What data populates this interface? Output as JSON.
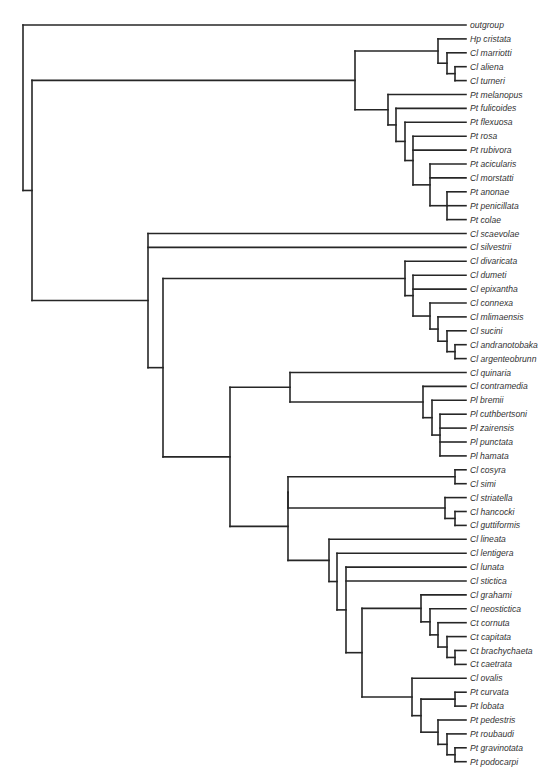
{
  "figure": {
    "type": "phylogenetic-tree",
    "line_color": "#262626",
    "label_x": 430,
    "leaf_end_x": 427,
    "first_leaf_y": 25,
    "leaf_step": 13.9
  },
  "leaves": [
    "outgroup",
    "Hp cristata",
    "Cl marriotti",
    "Cl aliena",
    "Cl turneri",
    "Pt melanopus",
    "Pt fulicoides",
    "Pt flexuosa",
    "Pt rosa",
    "Pt rubivora",
    "Pt acicularis",
    "Cl morstatti",
    "Pt anonae",
    "Pt penicillata",
    "Pt colae",
    "Cl scaevolae",
    "Cl silvestrii",
    "Cl divaricata",
    "Cl dumeti",
    "Cl epixantha",
    "Cl connexa",
    "Cl mlimaensis",
    "Cl sucini",
    "Cl andranotobaka",
    "Cl argenteobrunn",
    "Cl quinaria",
    "Cl contramedia",
    "Pl bremii",
    "Pl cuthbertsoni",
    "Pl zairensis",
    "Pl punctata",
    "Pl hamata",
    "Cl cosyra",
    "Cl simi",
    "Cl striatella",
    "Cl hancocki",
    "Cl guttiformis",
    "Cl lineata",
    "Cl lentigera",
    "Cl lunata",
    "Cl stictica",
    "Cl grahami",
    "Cl neostictica",
    "Ct cornuta",
    "Ct capitata",
    "Ct brachychaeta",
    "Ct caetrata",
    "Cl ovalis",
    "Pt curvata",
    "Pt lobata",
    "Pt pedestris",
    "Pt roubaudi",
    "Pt gravinotata",
    "Pt podocarpi"
  ],
  "tree": {
    "x": 23,
    "children": [
      {
        "leaf": 0
      },
      {
        "x": 32,
        "children": [
          {
            "x": 355,
            "children": [
              {
                "x": 438,
                "children": [
                  {
                    "leaf": 1
                  },
                  {
                    "x": 447,
                    "children": [
                      {
                        "leaf": 2
                      },
                      {
                        "x": 455,
                        "children": [
                          {
                            "leaf": 3
                          },
                          {
                            "leaf": 4
                          }
                        ]
                      }
                    ]
                  }
                ]
              },
              {
                "x": 388,
                "children": [
                  {
                    "leaf": 5
                  },
                  {
                    "x": 396,
                    "children": [
                      {
                        "leaf": 6
                      },
                      {
                        "x": 405,
                        "children": [
                          {
                            "leaf": 7
                          },
                          {
                            "x": 413,
                            "children": [
                              {
                                "leaf": 8
                              },
                              {
                                "leaf": 9
                              },
                              {
                                "x": 430,
                                "children": [
                                  {
                                    "leaf": 10
                                  },
                                  {
                                    "leaf": 11
                                  },
                                  {
                                    "x": 447,
                                    "children": [
                                      {
                                        "leaf": 12
                                      },
                                      {
                                        "leaf": 13
                                      },
                                      {
                                        "leaf": 14
                                      }
                                    ]
                                  }
                                ]
                              }
                            ]
                          }
                        ]
                      }
                    ]
                  }
                ]
              }
            ]
          },
          {
            "x": 148,
            "children": [
              {
                "leaf": 15
              },
              {
                "leaf": 16
              },
              {
                "x": 163,
                "children": [
                  {
                    "x": 405,
                    "children": [
                      {
                        "leaf": 17
                      },
                      {
                        "x": 413,
                        "children": [
                          {
                            "leaf": 18
                          },
                          {
                            "leaf": 19
                          },
                          {
                            "x": 430,
                            "children": [
                              {
                                "leaf": 20
                              },
                              {
                                "x": 438,
                                "children": [
                                  {
                                    "leaf": 21
                                  },
                                  {
                                    "x": 447,
                                    "children": [
                                      {
                                        "leaf": 22
                                      },
                                      {
                                        "x": 455,
                                        "children": [
                                          {
                                            "leaf": 23
                                          },
                                          {
                                            "leaf": 24
                                          }
                                        ]
                                      }
                                    ]
                                  }
                                ]
                              }
                            ]
                          }
                        ]
                      }
                    ]
                  },
                  {
                    "x": 230,
                    "children": [
                      {
                        "x": 290,
                        "children": [
                          {
                            "leaf": 25
                          },
                          {
                            "x": 423,
                            "children": [
                              {
                                "leaf": 26
                              },
                              {
                                "x": 432,
                                "children": [
                                  {
                                    "leaf": 27
                                  },
                                  {
                                    "x": 440,
                                    "children": [
                                      {
                                        "leaf": 28
                                      },
                                      {
                                        "leaf": 29
                                      },
                                      {
                                        "leaf": 30
                                      },
                                      {
                                        "leaf": 31
                                      }
                                    ]
                                  }
                                ]
                              }
                            ]
                          }
                        ]
                      },
                      {
                        "x": 288,
                        "children": [
                          {
                            "x": 288,
                            "children": [
                              {
                                "x": 455,
                                "children": [
                                  {
                                    "leaf": 32
                                  },
                                  {
                                    "leaf": 33
                                  }
                                ]
                              },
                              {
                                "x": 445,
                                "children": [
                                  {
                                    "leaf": 34
                                  },
                                  {
                                    "x": 455,
                                    "children": [
                                      {
                                        "leaf": 35
                                      },
                                      {
                                        "leaf": 36
                                      }
                                    ]
                                  }
                                ]
                              }
                            ]
                          },
                          {
                            "x": 329,
                            "children": [
                              {
                                "leaf": 37
                              },
                              {
                                "x": 337,
                                "children": [
                                  {
                                    "leaf": 38
                                  },
                                  {
                                    "x": 346,
                                    "children": [
                                      {
                                        "leaf": 39
                                      },
                                      {
                                        "leaf": 40
                                      },
                                      {
                                        "x": 362,
                                        "children": [
                                          {
                                            "x": 421,
                                            "children": [
                                              {
                                                "leaf": 41
                                              },
                                              {
                                                "x": 430,
                                                "children": [
                                                  {
                                                    "leaf": 42
                                                  },
                                                  {
                                                    "x": 438,
                                                    "children": [
                                                      {
                                                        "leaf": 43
                                                      },
                                                      {
                                                        "x": 447,
                                                        "children": [
                                                          {
                                                            "leaf": 44
                                                          },
                                                          {
                                                            "x": 455,
                                                            "children": [
                                                              {
                                                                "leaf": 45
                                                              },
                                                              {
                                                                "leaf": 46
                                                              }
                                                            ]
                                                          }
                                                        ]
                                                      }
                                                    ]
                                                  }
                                                ]
                                              }
                                            ]
                                          },
                                          {
                                            "x": 412,
                                            "children": [
                                              {
                                                "leaf": 47
                                              },
                                              {
                                                "x": 421,
                                                "children": [
                                                  {
                                                    "x": 455,
                                                    "children": [
                                                      {
                                                        "leaf": 48
                                                      },
                                                      {
                                                        "leaf": 49
                                                      }
                                                    ]
                                                  },
                                                  {
                                                    "x": 438,
                                                    "children": [
                                                      {
                                                        "leaf": 50
                                                      },
                                                      {
                                                        "x": 447,
                                                        "children": [
                                                          {
                                                            "leaf": 51
                                                          },
                                                          {
                                                            "x": 455,
                                                            "children": [
                                                              {
                                                                "leaf": 52
                                                              },
                                                              {
                                                                "leaf": 53
                                                              }
                                                            ]
                                                          }
                                                        ]
                                                      }
                                                    ]
                                                  }
                                                ]
                                              }
                                            ]
                                          }
                                        ]
                                      }
                                    ]
                                  }
                                ]
                              }
                            ]
                          }
                        ]
                      }
                    ]
                  }
                ]
              }
            ]
          }
        ]
      }
    ]
  }
}
